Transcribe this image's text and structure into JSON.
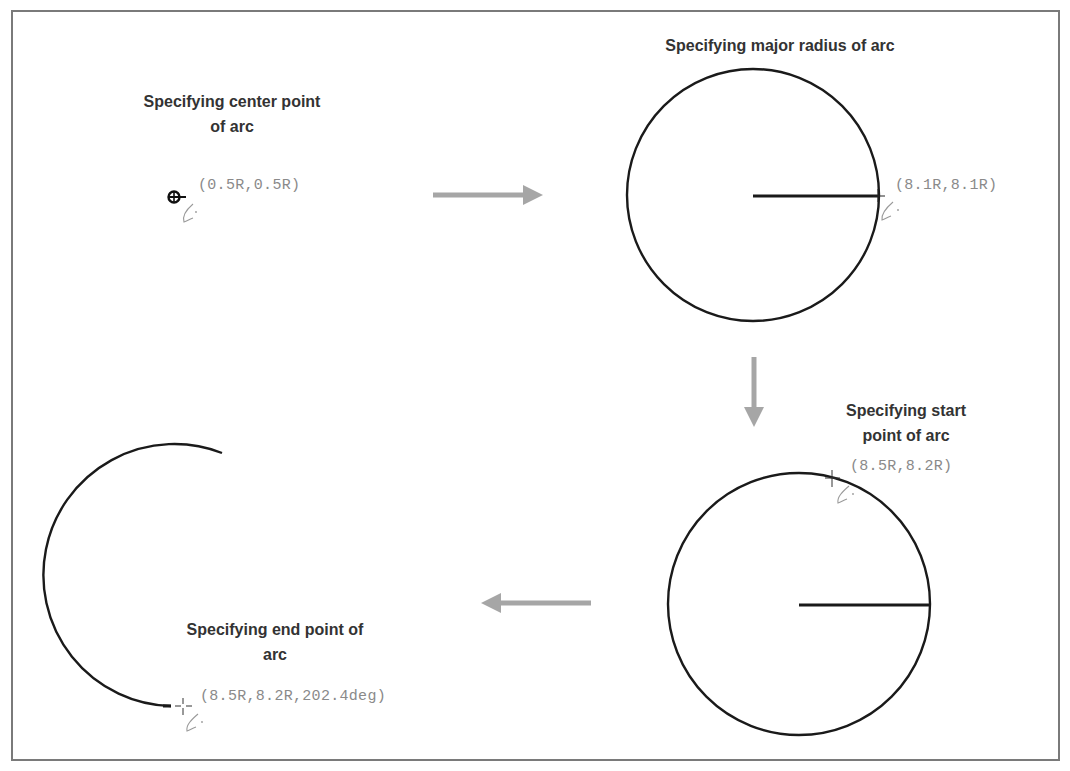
{
  "diagram": {
    "colors": {
      "frame": "#7a7a7a",
      "stroke": "#1a1a1a",
      "arrow": "#a6a6a6",
      "coord_text": "#8a8a8a",
      "title_text": "#333333",
      "pen_cursor": "#9a9a9a"
    },
    "steps": [
      {
        "id": "center-point",
        "title": "Specifying center point\nof arc",
        "coordinate_readout": "(0.5R,0.5R)",
        "cursor_icon": "center-point-marker-icon"
      },
      {
        "id": "major-radius",
        "title": "Specifying major radius of arc",
        "coordinate_readout": "(8.1R,8.1R)",
        "cursor_icon": "crosshair-icon"
      },
      {
        "id": "start-point",
        "title": "Specifying start\npoint of arc",
        "coordinate_readout": "(8.5R,8.2R)",
        "cursor_icon": "crosshair-icon"
      },
      {
        "id": "end-point",
        "title": "Specifying end point of\narc",
        "coordinate_readout": "(8.5R,8.2R,202.4deg)",
        "cursor_icon": "crosshair-icon"
      }
    ],
    "flow_arrows": [
      {
        "from": "center-point",
        "to": "major-radius",
        "direction": "right"
      },
      {
        "from": "major-radius",
        "to": "start-point",
        "direction": "down"
      },
      {
        "from": "start-point",
        "to": "end-point",
        "direction": "left"
      }
    ]
  }
}
